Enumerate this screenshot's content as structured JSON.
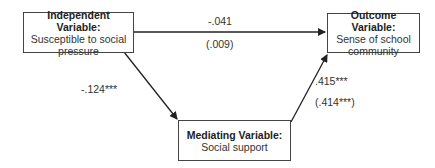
{
  "nodes": {
    "independent": {
      "title": "Independent Variable:",
      "line1": "Susceptible to social",
      "line2": "pressure"
    },
    "outcome": {
      "title": "Outcome Variable:",
      "line1": "Sense of school",
      "line2": "community"
    },
    "mediating": {
      "title": "Mediating Variable:",
      "line1": "Social support"
    }
  },
  "paths": {
    "direct": {
      "coef": "-.041",
      "coef_alt": "(.009)"
    },
    "a": {
      "coef": "-.124***"
    },
    "b": {
      "coef": ".415***",
      "coef_alt": "(.414***)"
    }
  }
}
